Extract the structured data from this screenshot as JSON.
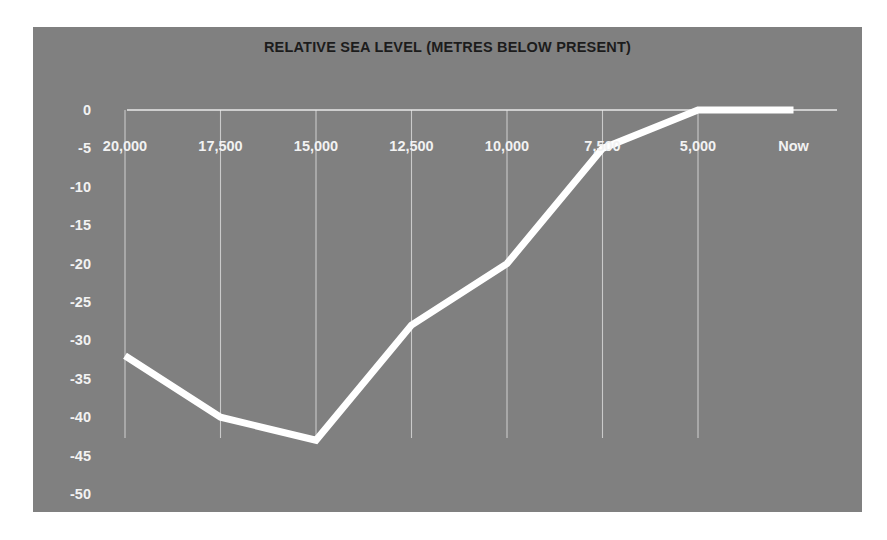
{
  "chart_data": {
    "type": "line",
    "title": "RELATIVE SEA LEVEL (METRES BELOW PRESENT)",
    "xlabel": "",
    "ylabel": "",
    "categories": [
      "20,000",
      "17,500",
      "15,000",
      "12,500",
      "10,000",
      "7,500",
      "5,000",
      "Now"
    ],
    "values": [
      -32,
      -40,
      -43,
      -28,
      -20,
      -5,
      0,
      0
    ],
    "series": [
      {
        "name": "Relative sea level",
        "values": [
          -32,
          -40,
          -43,
          -28,
          -20,
          -5,
          0,
          0
        ],
        "color": "#ffffff"
      }
    ],
    "ylim": [
      -50,
      0
    ],
    "yticks": [
      0,
      -5,
      -10,
      -15,
      -20,
      -25,
      -30,
      -35,
      -40,
      -45,
      -50
    ],
    "ytick_labels": [
      "0",
      "-5",
      "-10",
      "-15",
      "-20",
      "-25",
      "-30",
      "-35",
      "-40",
      "-45",
      "-50"
    ],
    "xtick_labels": [
      "20,000",
      "17,500",
      "15,000",
      "12,500",
      "10,000",
      "7,500",
      "5,000",
      "Now"
    ],
    "grid": "vertical-only",
    "legend": "none",
    "plot_background_color": "#808080",
    "line_color": "#ffffff",
    "gridline_color": "#d8d8d8",
    "axis_label_color": "#f2f2f2",
    "title_color": "#1c1c1c"
  }
}
